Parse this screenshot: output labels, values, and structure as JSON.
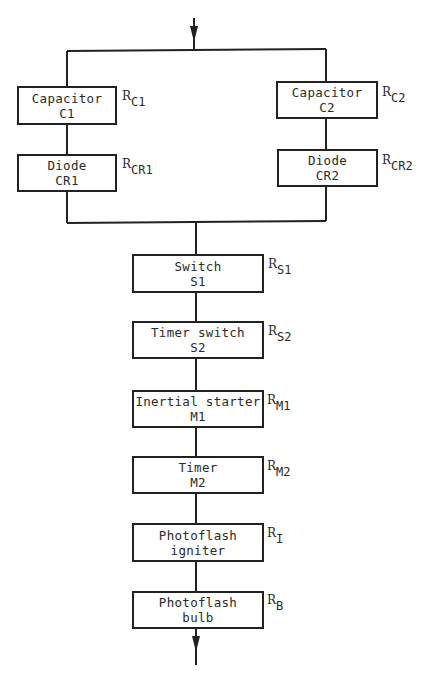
{
  "diagram": {
    "type": "reliability block diagram",
    "colors": {
      "line": "#222222",
      "text": "#2a2a2a",
      "background": "#ffffff"
    },
    "parallel_branches": [
      {
        "blocks": [
          {
            "line1": "Capacitor",
            "line2": "C1",
            "r_main": "R",
            "r_sub": "C1"
          },
          {
            "line1": "Diode",
            "line2": "CR1",
            "r_main": "R",
            "r_sub": "CR1"
          }
        ]
      },
      {
        "blocks": [
          {
            "line1": "Capacitor",
            "line2": "C2",
            "r_main": "R",
            "r_sub": "C2"
          },
          {
            "line1": "Diode",
            "line2": "CR2",
            "r_main": "R",
            "r_sub": "CR2"
          }
        ]
      }
    ],
    "series_chain": [
      {
        "line1": "Switch",
        "line2": "S1",
        "r_main": "R",
        "r_sub": "S1"
      },
      {
        "line1": "Timer switch",
        "line2": "S2",
        "r_main": "R",
        "r_sub": "S2"
      },
      {
        "line1": "Inertial starter",
        "line2": "M1",
        "r_main": "R",
        "r_sub": "M1"
      },
      {
        "line1": "Timer",
        "line2": "M2",
        "r_main": "R",
        "r_sub": "M2"
      },
      {
        "line1": "Photoflash",
        "line2": "igniter",
        "r_main": "R",
        "r_sub": "I"
      },
      {
        "line1": "Photoflash",
        "line2": "bulb",
        "r_main": "R",
        "r_sub": "B"
      }
    ],
    "input_arrow": "down-arrow",
    "output_arrow": "down-arrow"
  }
}
